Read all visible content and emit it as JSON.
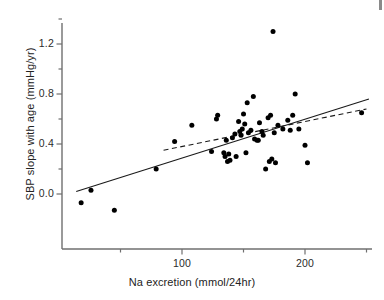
{
  "chart_data": {
    "type": "scatter",
    "title": "",
    "xlabel": "Na excretion (mmol/24hr)",
    "ylabel": "SBP slope with age (mmHg/yr)",
    "xlim": [
      10,
      255
    ],
    "ylim": [
      -0.22,
      1.42
    ],
    "xticks": [
      50,
      100,
      150,
      200,
      250
    ],
    "xtick_labels": [
      "",
      "100",
      "",
      "200",
      ""
    ],
    "yticks": [
      0.0,
      0.2,
      0.4,
      0.6,
      0.8,
      1.0,
      1.2,
      1.4
    ],
    "ytick_labels": [
      "0.0",
      "",
      "0.4",
      "",
      "0.8",
      "",
      "1.2",
      ""
    ],
    "grid": false,
    "legend": "none",
    "marker": "filled-circle",
    "points": [
      {
        "x": 18,
        "y": -0.07
      },
      {
        "x": 26,
        "y": 0.03
      },
      {
        "x": 45,
        "y": -0.13
      },
      {
        "x": 79,
        "y": 0.2
      },
      {
        "x": 94,
        "y": 0.42
      },
      {
        "x": 108,
        "y": 0.55
      },
      {
        "x": 124,
        "y": 0.34
      },
      {
        "x": 128,
        "y": 0.6
      },
      {
        "x": 129,
        "y": 0.63
      },
      {
        "x": 134,
        "y": 0.33
      },
      {
        "x": 135,
        "y": 0.3
      },
      {
        "x": 136,
        "y": 0.43
      },
      {
        "x": 137,
        "y": 0.26
      },
      {
        "x": 138,
        "y": 0.32
      },
      {
        "x": 139,
        "y": 0.27
      },
      {
        "x": 141,
        "y": 0.45
      },
      {
        "x": 143,
        "y": 0.48
      },
      {
        "x": 144,
        "y": 0.3
      },
      {
        "x": 146,
        "y": 0.58
      },
      {
        "x": 147,
        "y": 0.5
      },
      {
        "x": 148,
        "y": 0.47
      },
      {
        "x": 149,
        "y": 0.52
      },
      {
        "x": 150,
        "y": 0.64
      },
      {
        "x": 151,
        "y": 0.56
      },
      {
        "x": 152,
        "y": 0.33
      },
      {
        "x": 153,
        "y": 0.73
      },
      {
        "x": 154,
        "y": 0.49
      },
      {
        "x": 156,
        "y": 0.51
      },
      {
        "x": 158,
        "y": 0.78
      },
      {
        "x": 159,
        "y": 0.44
      },
      {
        "x": 161,
        "y": 0.43
      },
      {
        "x": 162,
        "y": 0.43
      },
      {
        "x": 163,
        "y": 0.57
      },
      {
        "x": 165,
        "y": 0.5
      },
      {
        "x": 166,
        "y": 0.47
      },
      {
        "x": 168,
        "y": 0.2
      },
      {
        "x": 170,
        "y": 0.61
      },
      {
        "x": 171,
        "y": 0.26
      },
      {
        "x": 172,
        "y": 0.63
      },
      {
        "x": 173,
        "y": 0.28
      },
      {
        "x": 174,
        "y": 1.3
      },
      {
        "x": 175,
        "y": 0.49
      },
      {
        "x": 176,
        "y": 0.25
      },
      {
        "x": 178,
        "y": 0.55
      },
      {
        "x": 182,
        "y": 0.52
      },
      {
        "x": 186,
        "y": 0.59
      },
      {
        "x": 188,
        "y": 0.51
      },
      {
        "x": 190,
        "y": 0.63
      },
      {
        "x": 192,
        "y": 0.8
      },
      {
        "x": 195,
        "y": 0.52
      },
      {
        "x": 200,
        "y": 0.39
      },
      {
        "x": 202,
        "y": 0.25
      },
      {
        "x": 246,
        "y": 0.65
      }
    ],
    "lines": [
      {
        "name": "regression-all",
        "style": "solid",
        "x1": 14,
        "y1": 0.02,
        "x2": 252,
        "y2": 0.76
      },
      {
        "name": "regression-excluding-extremes",
        "style": "dashed",
        "x1": 85,
        "y1": 0.35,
        "x2": 250,
        "y2": 0.68
      }
    ]
  },
  "axes": {
    "x_label": "Na excretion (mmol/24hr)",
    "y_label": "SBP slope with age (mmHg/yr)",
    "x_tick_texts": [
      {
        "value": 100,
        "text": "100"
      },
      {
        "value": 200,
        "text": "200"
      }
    ],
    "y_tick_texts": [
      {
        "value": 1.2,
        "text": "1.2"
      },
      {
        "value": 0.8,
        "text": "0.8"
      },
      {
        "value": 0.4,
        "text": "0.4"
      },
      {
        "value": 0.0,
        "text": "0.0"
      }
    ]
  }
}
